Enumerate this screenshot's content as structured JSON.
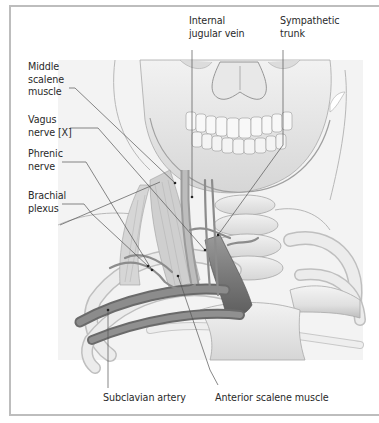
{
  "figure": {
    "labels": [
      {
        "id": "internal-jugular-vein",
        "text": "Internal\njugular vein"
      },
      {
        "id": "sympathetic-trunk",
        "text": "Sympathetic\ntrunk"
      },
      {
        "id": "middle-scalene-muscle",
        "text": "Middle\nscalene\nmuscle"
      },
      {
        "id": "vagus-nerve",
        "text": "Vagus\nnerve [X]"
      },
      {
        "id": "phrenic-nerve",
        "text": "Phrenic\nnerve"
      },
      {
        "id": "brachial-plexus",
        "text": "Brachial\nplexus"
      },
      {
        "id": "subclavian-artery",
        "text": "Subclavian artery"
      },
      {
        "id": "anterior-scalene-muscle",
        "text": "Anterior scalene muscle"
      }
    ]
  },
  "colors": {
    "frame": "#bdbdbd",
    "bone": "#e6e6e6",
    "bone_shadow": "#bcbcbc",
    "vessel": "#8a8a8a",
    "muscle": "#c4c4c4",
    "leader": "#555555",
    "text": "#2a2a2a"
  }
}
